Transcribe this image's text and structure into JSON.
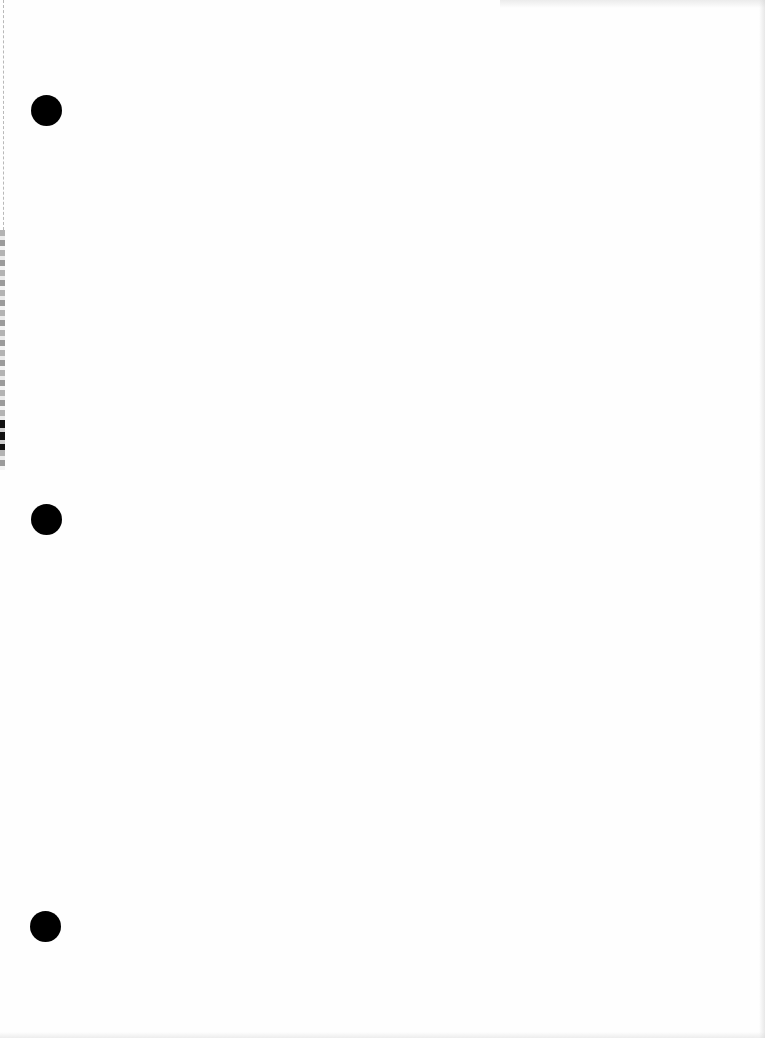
{
  "document": {
    "type": "blank three-hole-punched sheet",
    "background_color": "#fefefe",
    "hole_color": "#000000",
    "hole_count": 3,
    "holes": [
      {
        "position": "top",
        "center_x": 46,
        "center_y": 110
      },
      {
        "position": "middle",
        "center_x": 46,
        "center_y": 519
      },
      {
        "position": "bottom",
        "center_x": 45,
        "center_y": 926
      }
    ],
    "text": ""
  }
}
